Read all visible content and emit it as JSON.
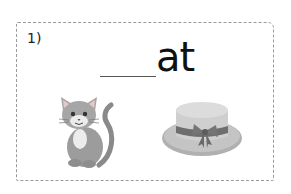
{
  "worksheet": {
    "item_number": "1)",
    "blank": "____",
    "word_ending": "at",
    "pictures": [
      {
        "name": "cat",
        "icon": "cat-icon"
      },
      {
        "name": "hat",
        "icon": "hat-icon"
      }
    ]
  }
}
